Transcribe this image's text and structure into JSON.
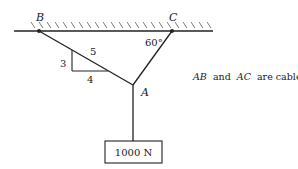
{
  "diagram": {
    "labels": {
      "B": "B",
      "C": "C",
      "A": "A",
      "angle": "60°",
      "slope_hyp": "5",
      "slope_rise": "3",
      "slope_run": "4"
    },
    "load": {
      "text": "1000 N"
    },
    "note": {
      "ab": "AB",
      "and": "and",
      "ac": "AC",
      "rest": "are cables"
    },
    "colors": {
      "line": "#222222",
      "background": "#ffffff"
    }
  }
}
